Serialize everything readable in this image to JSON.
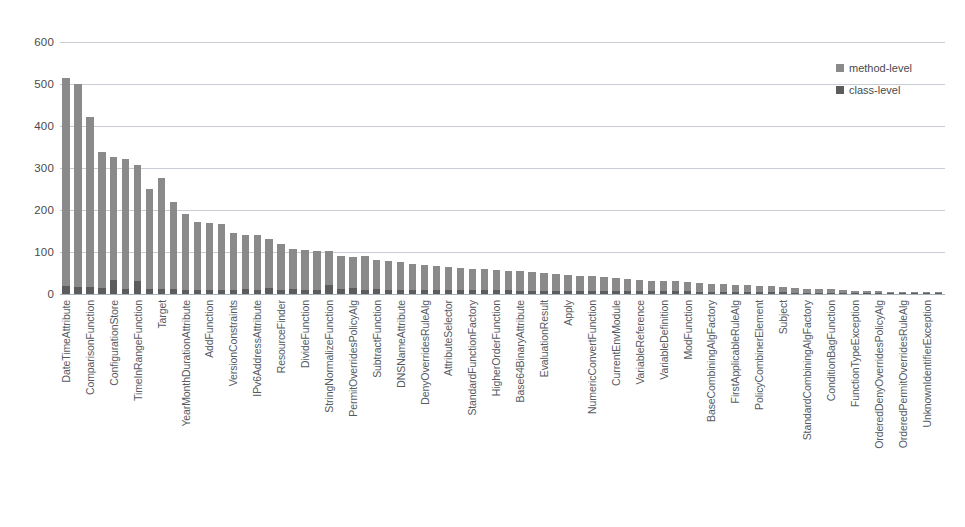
{
  "chart_data": {
    "type": "bar",
    "stacked": true,
    "title": "",
    "xlabel": "",
    "ylabel": "",
    "ylim": [
      0,
      600
    ],
    "yticks": [
      0,
      100,
      200,
      300,
      400,
      500,
      600
    ],
    "grid": true,
    "legend_position": "top-right",
    "label_interval": 2,
    "legend": [
      "method-level",
      "class-level"
    ],
    "colors": {
      "method-level": "#8a8a8a",
      "class-level": "#5c5c5c",
      "gridline": "#c8cdd4",
      "text": "#4a4a4a"
    },
    "categories": [
      "DateTimeAttribute",
      "AttributeFactory",
      "ComparisonFunction",
      "BasicFunctionFactoryProxy",
      "ConfigurationStore",
      "StandardAttributeFactory",
      "TimeInRangeFunction",
      "MatchFunction",
      "Target",
      "RuleCombinerElement",
      "YearMonthDurationAttribute",
      "DayTimeDurationAttribute",
      "AddFunction",
      "MultiplyFunction",
      "VersionConstraints",
      "GeneralBagFunction",
      "IPv6AddressAttribute",
      "RFC822NameAttribute",
      "ResourceFinder",
      "PolicyFinder",
      "DivideFunction",
      "AbsFunction",
      "StringNormalizeFunction",
      "LogicalFunction",
      "PermitOverridesPolicyAlg",
      "DenyOverridesPolicyAlg",
      "SubtractFunction",
      "RoundFunction",
      "DNSNameAttribute",
      "AnyURIAttribute",
      "DenyOverridesRuleAlg",
      "PermitOverridesRuleAlg",
      "AttributeSelector",
      "AttributeDesignator",
      "StandardFunctionFactory",
      "FunctionFactoryProxy",
      "HigherOrderFunction",
      "SetFunction",
      "Base64BinaryAttribute",
      "HexBinaryAttribute",
      "EvaluationResult",
      "ObligationResult",
      "Apply",
      "Condition",
      "NumericConvertFunction",
      "StringFunction",
      "CurrentEnvModule",
      "SelectorModule",
      "VariableReference",
      "PolicyReference",
      "VariableDefinition",
      "PolicyDefinition",
      "ModFunction",
      "FloorFunction",
      "BaseCombiningAlgFactory",
      "CombiningAlgFactoryProxy",
      "FirstApplicableRuleAlg",
      "OnlyOneApplicablePolicyAlg",
      "PolicyCombinerElement",
      "RuleSetElement",
      "Subject",
      "Resource",
      "StandardCombiningAlgFactory",
      "CombiningAlgorithm",
      "ConditionBagFunction",
      "BagFunction",
      "FunctionTypeException",
      "ParsingException",
      "OrderedDenyOverridesPolicyAlg",
      "OrderedPermitOverridesPolicyAlg",
      "OrderedPermitOverridesRuleAlg",
      "OrderedDenyOverridesRuleAlg",
      "UnknownIdentifierException",
      "ProcessingException"
    ],
    "series": [
      {
        "name": "class-level",
        "values": [
          18,
          16,
          16,
          14,
          34,
          12,
          30,
          12,
          12,
          12,
          10,
          10,
          10,
          10,
          10,
          12,
          10,
          14,
          10,
          12,
          10,
          10,
          22,
          12,
          14,
          10,
          12,
          10,
          10,
          10,
          10,
          10,
          10,
          10,
          10,
          10,
          10,
          10,
          8,
          8,
          8,
          8,
          8,
          8,
          8,
          8,
          6,
          6,
          6,
          6,
          6,
          6,
          6,
          4,
          4,
          4,
          4,
          4,
          4,
          4,
          4,
          3,
          3,
          3,
          3,
          3,
          2,
          2,
          2,
          2,
          2,
          2,
          2,
          2
        ]
      },
      {
        "name": "method-level",
        "values": [
          497,
          484,
          406,
          325,
          292,
          310,
          278,
          238,
          264,
          206,
          180,
          162,
          160,
          157,
          135,
          128,
          130,
          118,
          108,
          95,
          96,
          92,
          80,
          78,
          74,
          80,
          68,
          68,
          66,
          62,
          60,
          56,
          54,
          52,
          50,
          50,
          47,
          46,
          46,
          44,
          42,
          40,
          38,
          36,
          34,
          32,
          32,
          30,
          28,
          26,
          26,
          24,
          22,
          22,
          20,
          19,
          18,
          17,
          16,
          14,
          13,
          12,
          10,
          9,
          8,
          7,
          6,
          6,
          5,
          4,
          3,
          3,
          2,
          2
        ]
      }
    ],
    "visible_tick_labels": [
      "DateTimeAttribute",
      "ComparisonFunction",
      "ConfigurationStore",
      "TimeInRangeFunction",
      "Target",
      "YearMonthDurationAttribute",
      "AddFunction",
      "VersionConstraints",
      "IPv6AddressAttribute",
      "ResourceFinder",
      "DivideFunction",
      "StringNormalizeFunction",
      "PermitOverridesPolicyAlg",
      "SubtractFunction",
      "DNSNameAttribute",
      "DenyOverridesRuleAlg",
      "AttributeSelector",
      "StandardFunctionFactory",
      "HigherOrderFunction",
      "Base64BinaryAttribute",
      "EvaluationResult",
      "Apply",
      "NumericConvertFunction",
      "CurrentEnvModule",
      "VariableReference",
      "VariableDefinition",
      "ModFunction",
      "BaseCombiningAlgFactory",
      "FirstApplicableRuleAlg",
      "PolicyCombinerElement",
      "Subject",
      "StandardCombiningAlgFactory",
      "ConditionBagFunction",
      "FunctionTypeException",
      "OrderedDenyOverridesPolicyAlg",
      "OrderedPermitOverridesRuleAlg",
      "UnknownIdentifierException"
    ]
  },
  "legend": {
    "method_label": "method-level",
    "class_label": "class-level"
  }
}
